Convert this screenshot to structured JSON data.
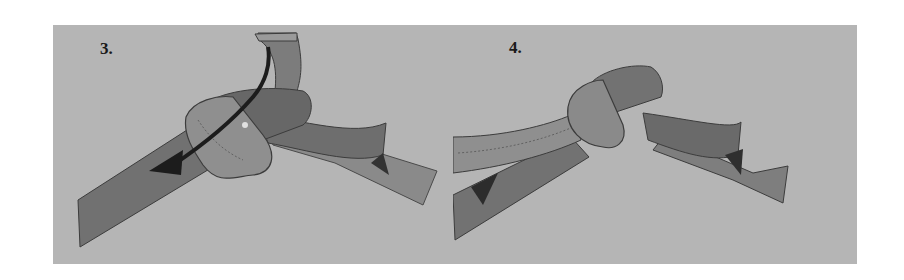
{
  "figure": {
    "colors": {
      "background": "#ffffff",
      "panel": "#b5b5b5",
      "belt_dark": "#707070",
      "belt_light": "#8e8e8e",
      "outline": "#3c3c3c",
      "arrow": "#1c1c1c"
    },
    "panels": [
      {
        "step": "3.",
        "illustration": "belt end passed down through the loop with arrow showing direction",
        "icons": [
          "direction-arrow-icon"
        ]
      },
      {
        "step": "4.",
        "illustration": "completed knot with both belt ends hanging",
        "icons": []
      }
    ]
  }
}
